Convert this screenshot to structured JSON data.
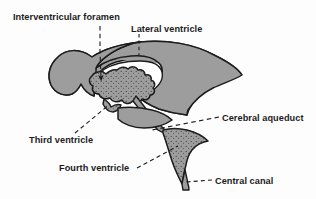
{
  "figure": {
    "background_color": "#fdfdfd",
    "ink_color": "#1c1c1c",
    "ventricle_fill": "#9d9d9d",
    "ventricle_stroke": "#1c1c1c",
    "cavity_fill": "#ffffff",
    "stipple_color": "#3a3a3a"
  },
  "labels": {
    "interventricular_foramen": "Interventricular foramen",
    "lateral_ventricle": "Lateral ventricle",
    "cerebral_aqueduct": "Cerebral aqueduct",
    "third_ventricle": "Third ventricle",
    "fourth_ventricle": "Fourth ventricle",
    "central_canal": "Central canal"
  },
  "leaders": [
    {
      "name": "interventricular-foramen-leader",
      "style": "dashed-arrow",
      "from": [
        100,
        26
      ],
      "to": [
        101,
        78
      ]
    },
    {
      "name": "lateral-ventricle-leader",
      "style": "dashed-plain",
      "from": [
        139,
        33
      ],
      "to": [
        139,
        56
      ]
    },
    {
      "name": "cerebral-aqueduct-leader",
      "style": "dashed-plain",
      "from": [
        219,
        117
      ],
      "to": [
        152,
        130
      ]
    },
    {
      "name": "third-ventricle-leader",
      "style": "dashed-plain",
      "from": [
        74,
        133
      ],
      "to": [
        110,
        104
      ]
    },
    {
      "name": "fourth-ventricle-leader",
      "style": "dashed-plain",
      "from": [
        137,
        168
      ],
      "to": [
        178,
        146
      ]
    },
    {
      "name": "central-canal-leader",
      "style": "dashed-plain",
      "from": [
        212,
        180
      ],
      "to": [
        186,
        182
      ]
    }
  ]
}
